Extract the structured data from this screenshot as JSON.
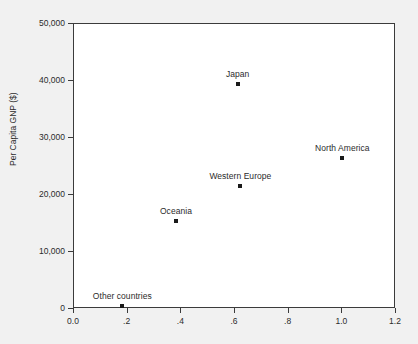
{
  "chart_data": {
    "type": "scatter",
    "title": "",
    "xlabel": "",
    "ylabel": "Per Capita GNP ($)",
    "xlim": [
      0.0,
      1.2
    ],
    "ylim": [
      0,
      50000
    ],
    "grid": false,
    "legend": "none",
    "x_ticks": [
      0.0,
      0.2,
      0.4,
      0.6,
      0.8,
      1.0,
      1.2
    ],
    "x_tick_labels": [
      "0.0",
      ".2",
      ".4",
      ".6",
      ".8",
      "1.0",
      "1.2"
    ],
    "y_ticks": [
      0,
      10000,
      20000,
      30000,
      40000,
      50000
    ],
    "y_tick_labels": [
      "0",
      "10,000",
      "20,000",
      "30,000",
      "40,000",
      "50,000"
    ],
    "marker_color": "#1a1a1a",
    "frame_color": "#3b3b3b",
    "points": [
      {
        "label": "Other countries",
        "x": 0.18,
        "y": 500
      },
      {
        "label": "Oceania",
        "x": 0.38,
        "y": 15500
      },
      {
        "label": "Western Europe",
        "x": 0.62,
        "y": 21500
      },
      {
        "label": "Japan",
        "x": 0.61,
        "y": 39500
      },
      {
        "label": "North America",
        "x": 1.0,
        "y": 26500
      }
    ]
  }
}
